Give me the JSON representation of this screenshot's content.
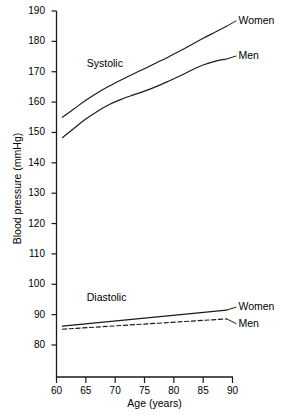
{
  "chart_data": {
    "type": "line",
    "title": "",
    "xlabel": "Age (years)",
    "ylabel": "Blood pressure (mmHg)",
    "xlim": [
      60,
      90
    ],
    "ylim": [
      77,
      190
    ],
    "grid": false,
    "legend_position": "right-of-line-ends",
    "x_ticks": [
      60,
      65,
      70,
      75,
      80,
      85,
      90
    ],
    "y_ticks": [
      80,
      90,
      100,
      110,
      120,
      130,
      140,
      150,
      160,
      170,
      180,
      190
    ],
    "x_tick_labels": [
      "60",
      "65",
      "70",
      "75",
      "80",
      "85",
      "90"
    ],
    "y_tick_labels": [
      "80",
      "90",
      "100",
      "110",
      "120",
      "130",
      "140",
      "150",
      "160",
      "170",
      "180",
      "190"
    ],
    "group_annotations": [
      {
        "text": "Systolic",
        "x": 65.5,
        "y": 172.5
      },
      {
        "text": "Diastolic",
        "x": 65.5,
        "y": 95.5
      }
    ],
    "series": [
      {
        "name": "Women",
        "group": "Systolic",
        "style": "solid",
        "color": "#1a1a1a",
        "end_label": "Women",
        "x": [
          61,
          63,
          65,
          67,
          69,
          71,
          73,
          75,
          77,
          79,
          81,
          83,
          85,
          87,
          89
        ],
        "values": [
          155.0,
          157.8,
          160.6,
          163.1,
          165.3,
          167.3,
          169.2,
          171.0,
          172.9,
          174.8,
          176.8,
          178.9,
          181.0,
          183.0,
          185.0
        ]
      },
      {
        "name": "Men",
        "group": "Systolic",
        "style": "solid",
        "color": "#1a1a1a",
        "end_label": "Men",
        "x": [
          61,
          63,
          65,
          67,
          69,
          71,
          73,
          75,
          77,
          79,
          81,
          83,
          85,
          87,
          89
        ],
        "values": [
          148.3,
          151.4,
          154.4,
          157.0,
          159.2,
          160.9,
          162.3,
          163.6,
          165.1,
          166.8,
          168.6,
          170.5,
          172.2,
          173.4,
          174.2
        ]
      },
      {
        "name": "Women",
        "group": "Diastolic",
        "style": "solid",
        "color": "#1a1a1a",
        "end_label": "Women",
        "x": [
          61,
          89
        ],
        "values": [
          86.2,
          91.5
        ]
      },
      {
        "name": "Men",
        "group": "Diastolic",
        "style": "dashed",
        "color": "#1a1a1a",
        "end_label": "Men",
        "x": [
          61,
          89
        ],
        "values": [
          85.2,
          88.6
        ]
      }
    ],
    "end_labels": [
      {
        "text": "Women",
        "group": "Systolic",
        "x": 90.5,
        "y": 186.8
      },
      {
        "text": "Men",
        "group": "Systolic",
        "x": 90.5,
        "y": 175.2
      },
      {
        "text": "Women",
        "group": "Diastolic",
        "x": 90.5,
        "y": 92.5
      },
      {
        "text": "Men",
        "group": "Diastolic",
        "x": 90.5,
        "y": 87.0
      }
    ]
  }
}
